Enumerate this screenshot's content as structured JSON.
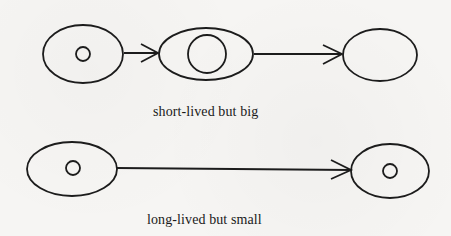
{
  "diagram": {
    "stroke_color": "#1c1c1c",
    "background_color": "#f6f5f3",
    "rows": [
      {
        "id": "short-lived",
        "caption": "short-lived but big",
        "nodes": [
          {
            "id": "s1",
            "cx": 83,
            "cy": 54,
            "rx": 40,
            "ry": 29,
            "inner_r": 7
          },
          {
            "id": "s2",
            "cx": 206,
            "cy": 54,
            "rx": 47,
            "ry": 26,
            "inner_r": 19
          },
          {
            "id": "s3",
            "cx": 380,
            "cy": 55,
            "rx": 37,
            "ry": 26,
            "inner_r": 0
          }
        ],
        "edges": [
          {
            "from": "s1",
            "to": "s2"
          },
          {
            "from": "s2",
            "to": "s3"
          }
        ]
      },
      {
        "id": "long-lived",
        "caption": "long-lived but small",
        "nodes": [
          {
            "id": "l1",
            "cx": 72,
            "cy": 169,
            "rx": 45,
            "ry": 27,
            "inner_r": 7
          },
          {
            "id": "l2",
            "cx": 390,
            "cy": 171,
            "rx": 39,
            "ry": 27,
            "inner_r": 7
          }
        ],
        "edges": [
          {
            "from": "l1",
            "to": "l2"
          }
        ]
      }
    ]
  }
}
